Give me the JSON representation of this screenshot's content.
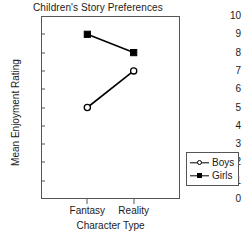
{
  "chart_data": {
    "type": "line",
    "title": "Children's Story Preferences",
    "xlabel": "Character Type",
    "ylabel": "Mean Enjoyment Rating",
    "categories": [
      "Fantasy",
      "Reality"
    ],
    "series": [
      {
        "name": "Boys",
        "values": [
          5,
          7
        ],
        "marker": "open-circle",
        "color": "#000000"
      },
      {
        "name": "Girls",
        "values": [
          9,
          8
        ],
        "marker": "filled-square",
        "color": "#000000"
      }
    ],
    "ylim": [
      0,
      10
    ],
    "yticks": [
      "0",
      "1",
      "2",
      "3",
      "4",
      "5",
      "6",
      "7",
      "8",
      "9",
      "10"
    ],
    "grid": false,
    "legend_position": "right",
    "legend_entries": [
      "Boys",
      "Girls"
    ]
  },
  "legend": {
    "boys_label": "Boys",
    "girls_label": "Girls"
  }
}
